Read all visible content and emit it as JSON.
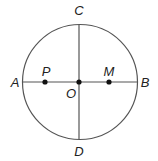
{
  "diagram": {
    "type": "geometry-circle",
    "colors": {
      "stroke": "#555555",
      "point": "#111111",
      "label": "#222222",
      "background": "#ffffff"
    },
    "circle": {
      "cx": 80,
      "cy": 82,
      "r": 57.5
    },
    "segments": [
      {
        "name": "AB",
        "from": "A",
        "to": "B"
      },
      {
        "name": "CD",
        "from": "C",
        "to": "D"
      }
    ],
    "points": {
      "A": {
        "label": "A",
        "x": 22.5,
        "y": 82,
        "label_x": 15,
        "label_y": 87
      },
      "B": {
        "label": "B",
        "x": 137.5,
        "y": 82,
        "label_x": 145,
        "label_y": 87
      },
      "C": {
        "label": "C",
        "x": 79,
        "y": 24.5,
        "label_x": 79,
        "label_y": 15
      },
      "D": {
        "label": "D",
        "x": 79,
        "y": 139.5,
        "label_x": 79,
        "label_y": 156
      },
      "O": {
        "label": "O",
        "x": 79,
        "y": 82,
        "label_x": 71,
        "label_y": 98
      },
      "P": {
        "label": "P",
        "x": 45,
        "y": 82,
        "label_x": 46,
        "label_y": 76
      },
      "M": {
        "label": "M",
        "x": 109,
        "y": 82,
        "label_x": 109,
        "label_y": 76
      }
    },
    "marked_points": [
      "P",
      "O",
      "M"
    ]
  }
}
